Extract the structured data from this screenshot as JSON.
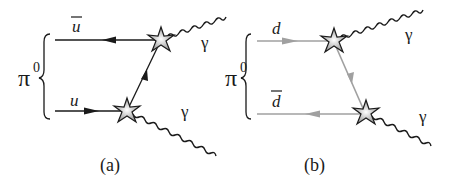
{
  "panels": [
    {
      "id": "a",
      "caption": "(a)",
      "meson": "π",
      "meson_sup": "0",
      "quark_top": "u",
      "quark_top_bar": true,
      "quark_bottom": "u",
      "quark_bottom_bar": false,
      "photon_top": "γ",
      "photon_bottom": "γ",
      "line_color": "#1a1a1a"
    },
    {
      "id": "b",
      "caption": "(b)",
      "meson": "π",
      "meson_sup": "0",
      "quark_top": "d",
      "quark_top_bar": false,
      "quark_bottom": "d",
      "quark_bottom_bar": true,
      "photon_top": "γ",
      "photon_bottom": "γ",
      "line_color": "#a0a0a0"
    }
  ]
}
